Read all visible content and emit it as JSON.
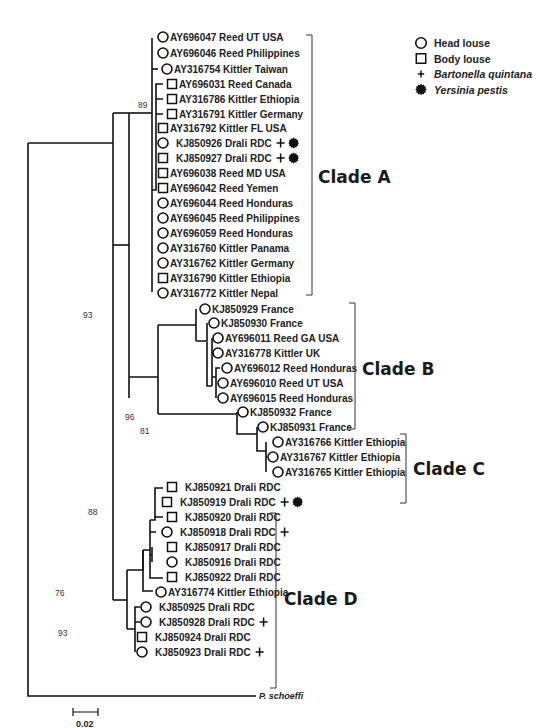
{
  "legend": {
    "items": [
      {
        "symbol": "circle",
        "label": "Head louse",
        "italic": false
      },
      {
        "symbol": "square",
        "label": "Body louse",
        "italic": false
      },
      {
        "symbol": "plus",
        "label": "Bartonella quintana",
        "italic": true
      },
      {
        "symbol": "blob",
        "label": "Yersinia pestis",
        "italic": true
      }
    ]
  },
  "clades": [
    {
      "label": "Clade A",
      "bracket": {
        "x": 312,
        "y1": 35,
        "y2": 295
      },
      "label_pos": {
        "x": 318,
        "y": 183
      }
    },
    {
      "label": "Clade B",
      "bracket": {
        "x": 355,
        "y1": 303,
        "y2": 429
      },
      "label_pos": {
        "x": 362,
        "y": 375
      }
    },
    {
      "label": "Clade C",
      "bracket": {
        "x": 406,
        "y1": 434,
        "y2": 503
      },
      "label_pos": {
        "x": 413,
        "y": 475
      }
    },
    {
      "label": "Clade D",
      "bracket": {
        "x": 276,
        "y1": 513,
        "y2": 688
      },
      "label_pos": {
        "x": 284,
        "y": 605
      }
    }
  ],
  "taxa": [
    {
      "id": "AY696047",
      "label": "AY696047 Reed UT USA",
      "host": "circle",
      "x": 163,
      "y": 37,
      "bq": false,
      "yp": false
    },
    {
      "id": "AY696046",
      "label": "AY696046 Reed Philippines",
      "host": "circle",
      "x": 163,
      "y": 53,
      "bq": false,
      "yp": false
    },
    {
      "id": "AY316754",
      "label": "AY316754 Kittler Taiwan",
      "host": "circle",
      "x": 167,
      "y": 69,
      "bq": false,
      "yp": false
    },
    {
      "id": "AY696031",
      "label": "AY696031 Reed Canada",
      "host": "square",
      "x": 172,
      "y": 84,
      "bq": false,
      "yp": false
    },
    {
      "id": "AY316786",
      "label": "AY316786 Kittler Ethiopia",
      "host": "square",
      "x": 172,
      "y": 99,
      "bq": false,
      "yp": false
    },
    {
      "id": "AY316791",
      "label": "AY316791 Kittler Germany",
      "host": "square",
      "x": 172,
      "y": 114,
      "bq": false,
      "yp": false
    },
    {
      "id": "AY316792",
      "label": "AY316792 Kittler FL USA",
      "host": "square",
      "x": 163,
      "y": 128,
      "bq": false,
      "yp": false
    },
    {
      "id": "KJ850926",
      "label": "KJ850926 Drali RDC",
      "host": "circle",
      "x": 163,
      "y": 143,
      "bq": true,
      "yp": true
    },
    {
      "id": "KJ850927",
      "label": "KJ850927 Drali RDC",
      "host": "square",
      "x": 163,
      "y": 158,
      "bq": true,
      "yp": true
    },
    {
      "id": "AY696038",
      "label": "AY696038 Reed MD USA",
      "host": "square",
      "x": 163,
      "y": 173,
      "bq": false,
      "yp": false
    },
    {
      "id": "AY696042",
      "label": "AY696042 Reed Yemen",
      "host": "square",
      "x": 163,
      "y": 188,
      "bq": false,
      "yp": false
    },
    {
      "id": "AY696044",
      "label": "AY696044 Reed Honduras",
      "host": "circle",
      "x": 163,
      "y": 203,
      "bq": false,
      "yp": false
    },
    {
      "id": "AY696045",
      "label": "AY696045 Reed Philippines",
      "host": "circle",
      "x": 163,
      "y": 218,
      "bq": false,
      "yp": false
    },
    {
      "id": "AY696059",
      "label": "AY696059 Reed Honduras",
      "host": "circle",
      "x": 163,
      "y": 233,
      "bq": false,
      "yp": false
    },
    {
      "id": "AY316760",
      "label": "AY316760 Kittler Panama",
      "host": "circle",
      "x": 163,
      "y": 248,
      "bq": false,
      "yp": false
    },
    {
      "id": "AY316762",
      "label": "AY316762 Kittler Germany",
      "host": "circle",
      "x": 163,
      "y": 263,
      "bq": false,
      "yp": false
    },
    {
      "id": "AY316790",
      "label": "AY316790 Kittler Ethiopia",
      "host": "square",
      "x": 163,
      "y": 278,
      "bq": false,
      "yp": false
    },
    {
      "id": "AY316772",
      "label": "AY316772 Kittler Nepal",
      "host": "circle",
      "x": 163,
      "y": 293,
      "bq": false,
      "yp": false
    },
    {
      "id": "KJ850929",
      "label": "KJ850929 France",
      "host": "circle",
      "x": 205,
      "y": 309,
      "bq": false,
      "yp": false
    },
    {
      "id": "KJ850930",
      "label": "KJ850930 France",
      "host": "circle",
      "x": 214,
      "y": 323,
      "bq": false,
      "yp": false
    },
    {
      "id": "AY696011",
      "label": "AY696011 Reed GA USA",
      "host": "circle",
      "x": 218,
      "y": 338,
      "bq": false,
      "yp": false
    },
    {
      "id": "AY316778",
      "label": "AY316778 Kittler UK",
      "host": "circle",
      "x": 218,
      "y": 353,
      "bq": false,
      "yp": false
    },
    {
      "id": "AY696012",
      "label": "AY696012 Reed Honduras",
      "host": "circle",
      "x": 227,
      "y": 368,
      "bq": false,
      "yp": false
    },
    {
      "id": "AY696010",
      "label": "AY696010 Reed UT USA",
      "host": "circle",
      "x": 223,
      "y": 383,
      "bq": false,
      "yp": false
    },
    {
      "id": "AY696015",
      "label": "AY696015 Reed Honduras",
      "host": "circle",
      "x": 223,
      "y": 398,
      "bq": false,
      "yp": false
    },
    {
      "id": "KJ850932",
      "label": "KJ850932 France",
      "host": "circle",
      "x": 243,
      "y": 412,
      "bq": false,
      "yp": false
    },
    {
      "id": "KJ850931",
      "label": "KJ850931 France",
      "host": "circle",
      "x": 263,
      "y": 427,
      "bq": false,
      "yp": false
    },
    {
      "id": "AY316766",
      "label": "AY316766 Kittler Ethiopia",
      "host": "circle",
      "x": 278,
      "y": 442,
      "bq": false,
      "yp": false
    },
    {
      "id": "AY316767",
      "label": "AY316767 Kittler Ethiopia",
      "host": "circle",
      "x": 273,
      "y": 457,
      "bq": false,
      "yp": false
    },
    {
      "id": "AY316765",
      "label": "AY316765 Kittler Ethiopia",
      "host": "circle",
      "x": 278,
      "y": 472,
      "bq": false,
      "yp": false
    },
    {
      "id": "KJ850921",
      "label": "KJ850921 Drali RDC",
      "host": "square",
      "x": 172,
      "y": 487,
      "bq": false,
      "yp": false
    },
    {
      "id": "KJ850919",
      "label": "KJ850919 Drali RDC",
      "host": "square",
      "x": 167,
      "y": 502,
      "bq": true,
      "yp": true
    },
    {
      "id": "KJ850920",
      "label": "KJ850920 Drali RDC",
      "host": "square",
      "x": 172,
      "y": 517,
      "bq": false,
      "yp": false
    },
    {
      "id": "KJ850918",
      "label": "KJ850918 Drali RDC",
      "host": "circle",
      "x": 167,
      "y": 532,
      "bq": true,
      "yp": false
    },
    {
      "id": "KJ850917",
      "label": "KJ850917 Drali RDC",
      "host": "square",
      "x": 172,
      "y": 547,
      "bq": false,
      "yp": false
    },
    {
      "id": "KJ850916",
      "label": "KJ850916 Drali RDC",
      "host": "circle",
      "x": 172,
      "y": 562,
      "bq": false,
      "yp": false
    },
    {
      "id": "KJ850922",
      "label": "KJ850922 Drali RDC",
      "host": "square",
      "x": 172,
      "y": 577,
      "bq": false,
      "yp": false
    },
    {
      "id": "AY316774",
      "label": "AY316774 Kittler Ethiopia",
      "host": "circle",
      "x": 161,
      "y": 592,
      "bq": false,
      "yp": false
    },
    {
      "id": "KJ850925",
      "label": "KJ850925 Drali RDC",
      "host": "circle",
      "x": 146,
      "y": 607,
      "bq": false,
      "yp": false
    },
    {
      "id": "KJ850928",
      "label": "KJ850928 Drali RDC",
      "host": "circle",
      "x": 146,
      "y": 622,
      "bq": true,
      "yp": false
    },
    {
      "id": "KJ850924",
      "label": "KJ850924 Drali RDC",
      "host": "square",
      "x": 142,
      "y": 637,
      "bq": false,
      "yp": false
    },
    {
      "id": "KJ850923",
      "label": "KJ850923 Drali RDC",
      "host": "circle",
      "x": 142,
      "y": 652,
      "bq": true,
      "yp": false
    }
  ],
  "outgroup": {
    "label": "P. schoeffi"
  },
  "bootstrap": [
    {
      "value": "89",
      "x": 138,
      "y": 108
    },
    {
      "value": "93",
      "x": 83,
      "y": 318
    },
    {
      "value": "96",
      "x": 125,
      "y": 420
    },
    {
      "value": "81",
      "x": 140,
      "y": 434
    },
    {
      "value": "88",
      "x": 88,
      "y": 515
    },
    {
      "value": "76",
      "x": 55,
      "y": 596
    },
    {
      "value": "93",
      "x": 58,
      "y": 636
    }
  ],
  "scale_bar": {
    "label": "0.02"
  },
  "caption": "FIGURE 1. Maximum likelihood (ML) phylogeny of the cytochrome b gene in head and body lice"
}
